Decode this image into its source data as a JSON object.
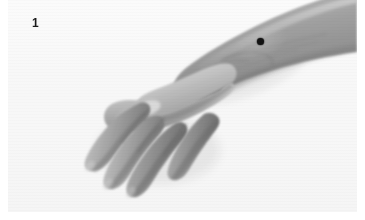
{
  "figure": {
    "number_label": "1",
    "caption": "",
    "orientation": "hand lower-left, forearm extending to upper-right"
  },
  "image": {
    "width_px": 365,
    "height_px": 220,
    "color_mode": "grayscale",
    "background_color": "#f7f7f7",
    "page_color": "#ffffff",
    "plate_left_px": 8,
    "plate_top_px": 0,
    "plate_width_px": 349,
    "plate_height_px": 212
  },
  "markers": [
    {
      "name": "acupoint-marker",
      "shape": "filled-circle",
      "color": "#121212",
      "x_px": 260,
      "y_px": 41,
      "diameter_px": 7,
      "location": "dorsal forearm, proximal to wrist"
    }
  ],
  "anatomy": {
    "skin_tone_light": "#cfcfcf",
    "skin_tone_mid": "#9a9a9a",
    "skin_tone_dark": "#6f6f6f",
    "shadow_tone": "#5a5a5a",
    "highlight_tone": "#e2e2e2",
    "parts": [
      "forearm",
      "wrist",
      "dorsum of hand",
      "thumb",
      "index finger",
      "middle finger",
      "ring finger",
      "little finger"
    ]
  }
}
